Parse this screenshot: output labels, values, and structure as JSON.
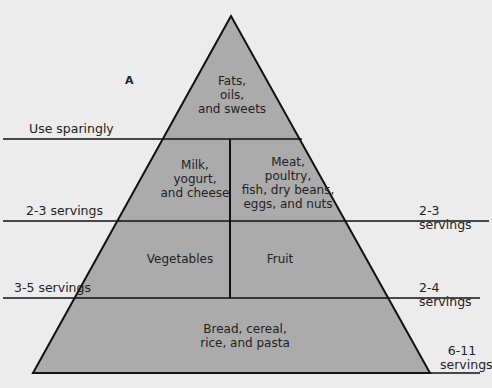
{
  "figure": {
    "panel_label": "A",
    "colors": {
      "fill": "#ababab",
      "line": "#111111",
      "background": "#ececec"
    },
    "tiers": [
      {
        "name": "Fats, oils, and sweets",
        "lines": [
          "Fats,",
          "oils,",
          "and sweets"
        ],
        "servings": "Use sparingly"
      },
      {
        "name": "Milk, yogurt, and cheese",
        "lines": [
          "Milk,",
          "yogurt,",
          "and cheese"
        ],
        "servings": "2-3 servings"
      },
      {
        "name": "Meat, poultry, fish, dry beans, eggs, and nuts",
        "lines": [
          "Meat,",
          "poultry,",
          "fish, dry beans,",
          "eggs, and nuts"
        ],
        "servings": "2-3 servings"
      },
      {
        "name": "Vegetables",
        "lines": [
          "Vegetables"
        ],
        "servings": "3-5 servings"
      },
      {
        "name": "Fruit",
        "lines": [
          "Fruit"
        ],
        "servings": "2-4 servings"
      },
      {
        "name": "Bread, cereal, rice, and pasta",
        "lines": [
          "Bread, cereal,",
          "rice, and pasta"
        ],
        "servings_lines": [
          "6-11",
          "servings"
        ],
        "servings": "6-11 servings"
      }
    ]
  }
}
